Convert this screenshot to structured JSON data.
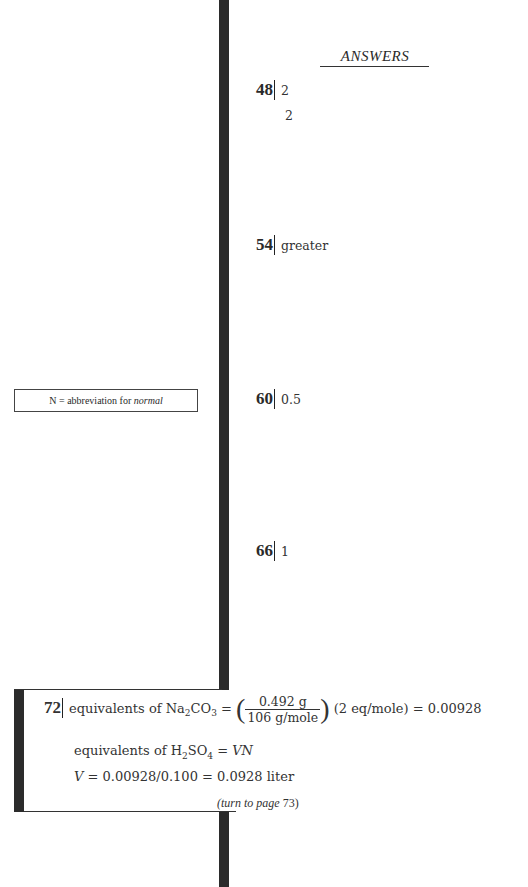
{
  "heading": "ANSWERS",
  "answers": [
    {
      "number": "48",
      "lines": [
        "2",
        "2"
      ]
    },
    {
      "number": "54",
      "lines": [
        "greater"
      ]
    },
    {
      "number": "60",
      "lines": [
        "0.5"
      ]
    },
    {
      "number": "66",
      "lines": [
        "1"
      ]
    }
  ],
  "side_note": {
    "prefix": "N = abbreviation for ",
    "term": "normal"
  },
  "frame72": {
    "number": "72",
    "line1": {
      "lhs": "equivalents of Na",
      "sub1": "2",
      "mid": "CO",
      "sub2": "3",
      "eq": " = ",
      "numerator": "0.492 g",
      "denominator": "106 g/mole",
      "rest": "(2 eq/mole) = 0.00928"
    },
    "line2": {
      "lhs": "equivalents of H",
      "sub1": "2",
      "mid": "SO",
      "sub2": "4",
      "rest": " = ",
      "var": "VN"
    },
    "line3": {
      "var": "V",
      "rest": " = 0.00928/0.100 = 0.0928 liter"
    },
    "footer": {
      "text": "(turn to page ",
      "page": "73",
      "close": ")"
    }
  }
}
